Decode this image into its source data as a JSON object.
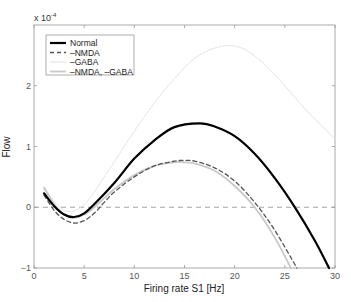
{
  "chart_data": {
    "type": "line",
    "title": "",
    "xlabel": "Firing rate S1 [Hz]",
    "ylabel": "Flow",
    "y_exponent_label": "x 10",
    "y_exponent_power": "-4",
    "xlim": [
      0,
      30
    ],
    "ylim": [
      -1,
      3
    ],
    "xticks": [
      0,
      5,
      10,
      15,
      20,
      25,
      30
    ],
    "yticks": [
      -1,
      0,
      1,
      2
    ],
    "grid": false,
    "legend_position": "upper-left",
    "reference_line": {
      "y": 0,
      "style": "dashed",
      "color": "#999999"
    },
    "series": [
      {
        "name": "Normal",
        "color": "#000000",
        "width": 2.2,
        "dash": "",
        "x": [
          1,
          2,
          3,
          4,
          5,
          6,
          8,
          10,
          12,
          14,
          16.5,
          18,
          20,
          22,
          24,
          26,
          28,
          29.4
        ],
        "y": [
          0.23,
          0.02,
          -0.12,
          -0.16,
          -0.1,
          0.05,
          0.4,
          0.8,
          1.1,
          1.32,
          1.38,
          1.33,
          1.17,
          0.88,
          0.48,
          0.0,
          -0.55,
          -1.0
        ]
      },
      {
        "name": "–NMDA",
        "color": "#555555",
        "width": 1.3,
        "dash": "4,3",
        "x": [
          1,
          2,
          3,
          4,
          5,
          6,
          7,
          8,
          10,
          12,
          14,
          15,
          16,
          18,
          20,
          22,
          24,
          26.2
        ],
        "y": [
          0.2,
          -0.05,
          -0.2,
          -0.26,
          -0.22,
          -0.1,
          0.08,
          0.25,
          0.5,
          0.68,
          0.76,
          0.77,
          0.76,
          0.65,
          0.43,
          0.08,
          -0.38,
          -1.0
        ]
      },
      {
        "name": "–GABA",
        "color": "#e4e4e4",
        "width": 1.0,
        "dash": "",
        "x": [
          1,
          2,
          3,
          4,
          5,
          6,
          8,
          10,
          12,
          14,
          16,
          18,
          19.5,
          21,
          23,
          25,
          27,
          30
        ],
        "y": [
          0.34,
          0.1,
          -0.05,
          -0.06,
          0.05,
          0.25,
          0.75,
          1.25,
          1.72,
          2.12,
          2.45,
          2.62,
          2.66,
          2.6,
          2.35,
          2.0,
          1.62,
          1.12
        ]
      },
      {
        "name": "–NMDA, –GABA",
        "color": "#c8c8c8",
        "width": 1.8,
        "dash": "",
        "x": [
          1,
          2,
          3,
          4,
          5,
          6,
          7,
          8,
          10,
          12,
          14,
          15,
          16,
          18,
          20,
          22,
          24,
          25.6
        ],
        "y": [
          0.32,
          0.05,
          -0.12,
          -0.17,
          -0.12,
          0.0,
          0.15,
          0.3,
          0.53,
          0.68,
          0.74,
          0.74,
          0.72,
          0.6,
          0.35,
          0.0,
          -0.5,
          -1.0
        ]
      }
    ]
  }
}
